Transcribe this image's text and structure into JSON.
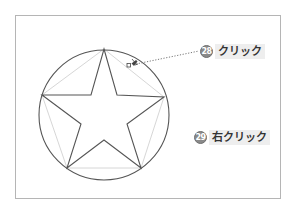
{
  "diagram": {
    "type": "star inscribed in circle",
    "colors": {
      "frame": "#b5b5b5",
      "shape_stroke": "#555555",
      "guide_stroke": "#cccccc",
      "badge_fill": "#8a8a8a",
      "label_bg": "#eeeeee"
    },
    "circle": {
      "cx": 104,
      "cy": 115,
      "r": 65
    },
    "star_points": "104,49 117,95 164,97 127,124 141,168 104,140 67,168 81,124 42,95 91,95",
    "pentagon_points": "104,49 164,97 141,168 67,168 42,95",
    "leader_line": {
      "x1": 136,
      "y1": 64,
      "x2": 199,
      "y2": 51
    }
  },
  "callouts": [
    {
      "number": "28",
      "label": "クリック"
    },
    {
      "number": "29",
      "label": "右クリック"
    }
  ],
  "cursor": {
    "icon": "pen-cursor-icon"
  }
}
